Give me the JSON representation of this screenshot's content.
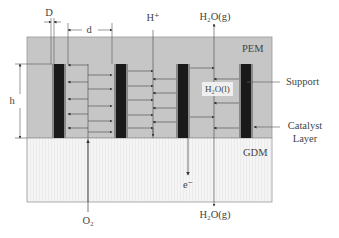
{
  "diagram": {
    "regions": {
      "pem": {
        "label": "PEM",
        "color": "#c6c6c6"
      },
      "gdm": {
        "label": "GDM",
        "color": "#f3f3f3"
      }
    },
    "dimensions": {
      "D": "D",
      "d": "d",
      "h": "h"
    },
    "species": {
      "h_plus": "H⁺",
      "h2o_gas_top": "H₂O(g)",
      "h2o_liquid": "H₂O(l)",
      "electron": "e⁻",
      "o2": "O₂",
      "h2o_gas_bottom": "H₂O(g)"
    },
    "callouts": {
      "support": "Support",
      "catalyst_line1": "Catalyst",
      "catalyst_line2": "Layer"
    },
    "colors": {
      "electrode_core": "#1a1a1a",
      "electrode_border": "#8a8a8a",
      "line": "#555555"
    },
    "electrode_count": 4
  }
}
